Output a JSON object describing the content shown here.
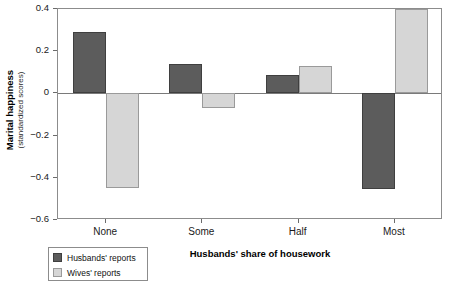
{
  "chart_data": {
    "type": "bar",
    "title": "",
    "subtitle": "",
    "xlabel": "Husbands' share of housework",
    "ylabel": "Marital happiness",
    "ylabel_sub": "(standardized scores)",
    "categories": [
      "None",
      "Some",
      "Half",
      "Most"
    ],
    "series": [
      {
        "name": "Husbands' reports",
        "color": "#5c5c5c",
        "values": [
          0.29,
          0.14,
          0.085,
          -0.455
        ]
      },
      {
        "name": "Wives' reports",
        "color": "#d6d6d6",
        "values": [
          -0.45,
          -0.07,
          0.13,
          0.4
        ]
      }
    ],
    "ylim": [
      -0.6,
      0.4
    ],
    "yticks": [
      0.4,
      0.2,
      0,
      -0.2,
      -0.4,
      -0.6
    ],
    "ytick_labels": [
      "0.4",
      "0.2",
      "0",
      "−0.2",
      "−0.4",
      "−0.6"
    ],
    "grid": false,
    "legend_position": "bottom-left",
    "zero_line": true
  },
  "axes": {
    "y_title_main": "Marital happiness",
    "y_title_sub": "(standardized scores)",
    "x_title": "Husbands' share of housework"
  },
  "legend": {
    "items": [
      {
        "label": "Husbands' reports",
        "swatch": "husbands"
      },
      {
        "label": "Wives' reports",
        "swatch": "wives"
      }
    ]
  }
}
